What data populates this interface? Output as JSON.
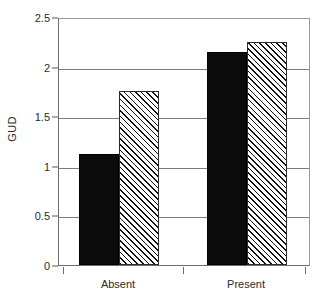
{
  "chart_data": {
    "type": "bar",
    "title": "",
    "subtitle": "",
    "xlabel": "",
    "ylabel": "GUD",
    "categories": [
      "Absent",
      "Present"
    ],
    "series": [
      {
        "name": "solid-black",
        "values": [
          1.12,
          2.15
        ]
      },
      {
        "name": "hatched",
        "values": [
          1.75,
          2.25
        ]
      }
    ],
    "ylim": [
      0,
      2.5
    ],
    "yticks": [
      0,
      0.5,
      1,
      1.5,
      2,
      2.5
    ],
    "ytick_labels": [
      "0",
      "0.5",
      "1",
      "1.5",
      "2",
      "2.5"
    ],
    "grid": true,
    "grid_axis": "y",
    "legend": "none",
    "bar_styles": [
      "solid",
      "diagonal-hatch"
    ],
    "colors": {
      "solid_fill": "#0b0b0b",
      "hatch_line": "#111111",
      "hatch_background": "#ffffff",
      "axis": "#6e6e6e",
      "gridline": "#7c7c7c",
      "text": "#2b2b2b"
    }
  },
  "axes": {
    "y_title": "GUD",
    "y_tick_labels": [
      "2.5",
      "2",
      "1.5",
      "1",
      "0.5",
      "0"
    ],
    "x_tick_labels": [
      "Absent",
      "Present"
    ]
  }
}
